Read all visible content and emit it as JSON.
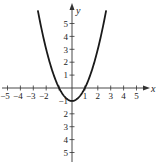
{
  "chart_data": {
    "type": "line",
    "title": "",
    "function": "y = x^2 - 1",
    "xlabel": "x",
    "ylabel": "y",
    "xlim": [
      -5.5,
      6
    ],
    "ylim": [
      -5.5,
      6
    ],
    "grid": false,
    "x_ticks": [
      -5,
      -4,
      -3,
      -2,
      -1,
      1,
      2,
      3,
      4,
      5
    ],
    "x_tick_labels": [
      "−5",
      "−4",
      "−3",
      "−2",
      "",
      "1",
      "2",
      "3",
      "4",
      "5"
    ],
    "y_ticks": [
      5,
      4,
      3,
      2,
      1,
      -1,
      -2,
      -3,
      -4,
      -5
    ],
    "y_tick_labels": [
      "5",
      "4",
      "3",
      "2",
      "1",
      "−1",
      "2",
      "3",
      "4",
      "5"
    ],
    "series": [
      {
        "name": "parabola",
        "x": [
          -2.65,
          -2,
          -1.5,
          -1,
          -0.5,
          0,
          0.5,
          1,
          1.5,
          2,
          2.65
        ],
        "y": [
          6.02,
          3,
          1.25,
          0,
          -0.75,
          -1,
          -0.75,
          0,
          1.25,
          3,
          6.02
        ]
      }
    ],
    "vertex": [
      0,
      -1
    ],
    "x_intercepts": [
      -1,
      1
    ]
  },
  "colors": {
    "curve": "#1a1a1a",
    "axis": "#333333",
    "text": "#222222"
  }
}
